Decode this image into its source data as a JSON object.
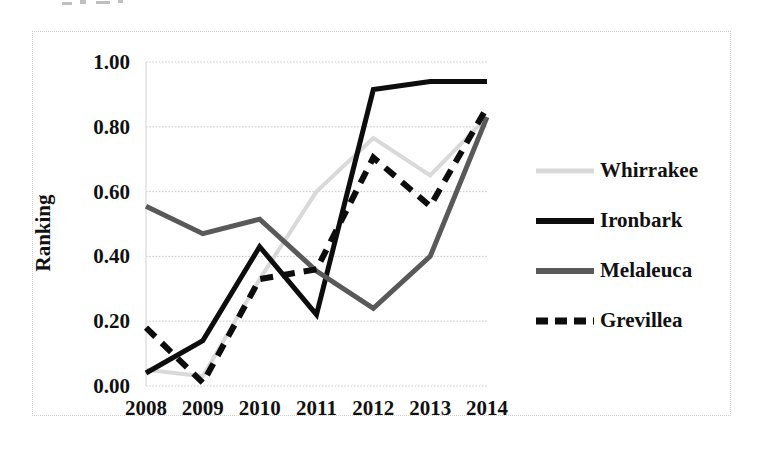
{
  "chart_data": {
    "type": "line",
    "title": "",
    "xlabel": "",
    "ylabel": "Ranking",
    "categories": [
      "2008",
      "2009",
      "2010",
      "2011",
      "2012",
      "2013",
      "2014"
    ],
    "x": [
      2008,
      2009,
      2010,
      2011,
      2012,
      2013,
      2014
    ],
    "ylim": [
      0.0,
      1.0
    ],
    "yticks": [
      "0.00",
      "0.20",
      "0.40",
      "0.60",
      "0.80",
      "1.00"
    ],
    "ytick_values": [
      0.0,
      0.2,
      0.4,
      0.6,
      0.8,
      1.0
    ],
    "grid": "horizontal-dotted",
    "legend_position": "right",
    "series": [
      {
        "name": "Whirrakee",
        "color": "#d9d9d9",
        "style": "solid",
        "width": 4,
        "values": [
          0.05,
          0.03,
          0.33,
          0.6,
          0.765,
          0.65,
          0.83
        ]
      },
      {
        "name": "Ironbark",
        "color": "#0d0d0d",
        "style": "solid",
        "width": 5,
        "values": [
          0.04,
          0.14,
          0.43,
          0.22,
          0.915,
          0.94,
          0.94
        ]
      },
      {
        "name": "Melaleuca",
        "color": "#595959",
        "style": "solid",
        "width": 5,
        "values": [
          0.555,
          0.47,
          0.515,
          0.355,
          0.24,
          0.4,
          0.83
        ]
      },
      {
        "name": "Grevillea",
        "color": "#0d0d0d",
        "style": "dashed",
        "width": 6,
        "values": [
          0.18,
          0.01,
          0.33,
          0.36,
          0.705,
          0.555,
          0.86
        ]
      }
    ]
  },
  "axis": {
    "y_title": "Ranking"
  },
  "legend": {
    "items": [
      {
        "label": "Whirrakee"
      },
      {
        "label": "Ironbark"
      },
      {
        "label": "Melaleuca"
      },
      {
        "label": "Grevillea"
      }
    ]
  }
}
